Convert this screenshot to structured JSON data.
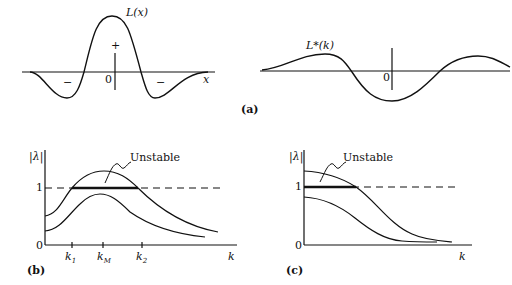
{
  "panel_a": {
    "label": "(a)",
    "left": {
      "curve_label": "L(x)",
      "x_axis_label": "x",
      "origin_label": "0",
      "plus_sign": "+",
      "minus_left": "−",
      "minus_right": "−"
    },
    "right": {
      "curve_label": "L*(k)",
      "origin_label": "0"
    }
  },
  "panel_b": {
    "label": "(b)",
    "y_axis_label": "|λ|",
    "x_axis_label": "k",
    "y_tick_1": "1",
    "y_tick_0": "0",
    "k1": "k",
    "k1_sub": "1",
    "kM": "k",
    "kM_sub": "M",
    "k2": "k",
    "k2_sub": "2",
    "annotation": "Unstable"
  },
  "panel_c": {
    "label": "(c)",
    "y_axis_label": "|λ|",
    "x_axis_label": "k",
    "y_tick_1": "1",
    "y_tick_0": "0",
    "annotation": "Unstable"
  },
  "colors": {
    "ink": "#111111",
    "background": "#ffffff"
  }
}
